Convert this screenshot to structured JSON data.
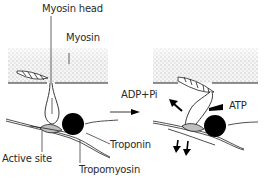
{
  "figure": {
    "labels": {
      "myosin_head": "Myosin head",
      "myosin": "Myosin",
      "active_site": "Active site",
      "troponin": "Troponin",
      "tropomyosin": "Tropomyosin",
      "adp_pi": "ADP+Pi",
      "atp": "ATP"
    },
    "panels": [
      {
        "name": "resting-state",
        "description": "Myosin head detached, tropomyosin covering active site"
      },
      {
        "name": "power-stroke",
        "description": "Myosin head bound to active site, releasing ADP+Pi and binding ATP"
      }
    ],
    "colors": {
      "line": "#222222",
      "stipple": "#bdbdbd",
      "troponin": "#000000",
      "active_site": "#bfbfbf"
    }
  }
}
